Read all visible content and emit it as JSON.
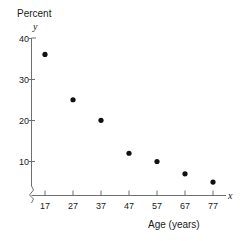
{
  "chart_data": {
    "type": "scatter",
    "title": "",
    "ylabel": "Percent",
    "yvar": "y",
    "xlabel": "Age (years)",
    "xvar": "x",
    "x": [
      17,
      27,
      37,
      47,
      57,
      67,
      77
    ],
    "values": [
      36,
      25,
      20,
      12,
      10,
      7,
      5
    ],
    "categories": [
      "17",
      "27",
      "37",
      "47",
      "57",
      "67",
      "77"
    ],
    "series": [
      {
        "name": "Percent",
        "points": [
          {
            "x": 17,
            "y": 36
          },
          {
            "x": 27,
            "y": 25
          },
          {
            "x": 37,
            "y": 20
          },
          {
            "x": 47,
            "y": 12
          },
          {
            "x": 57,
            "y": 10
          },
          {
            "x": 67,
            "y": 7
          },
          {
            "x": 77,
            "y": 5
          }
        ]
      }
    ],
    "yticks": [
      10,
      20,
      30,
      40
    ],
    "ytick_labels": [
      "10",
      "20",
      "30",
      "40"
    ],
    "xticks": [
      17,
      27,
      37,
      47,
      57,
      67,
      77
    ],
    "xtick_labels": [
      "17",
      "27",
      "37",
      "47",
      "57",
      "67",
      "77"
    ],
    "xlim": [
      12,
      82
    ],
    "ylim": [
      0,
      41
    ],
    "grid": false,
    "legend": false,
    "axis_break_x": true,
    "axis_break_y": true,
    "marker": "filled-circle",
    "marker_color": "#111111",
    "axis_color": "#6f6f6f",
    "background": "#ffffff"
  }
}
